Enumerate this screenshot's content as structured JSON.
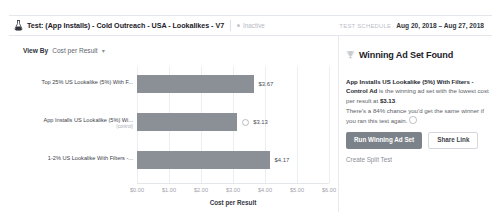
{
  "header": {
    "flask_icon": "flask-icon",
    "title": "Test: (App Installs) - Cold Outreach - USA - Lookalikes - V7",
    "status_badge": "Inactive",
    "schedule_label": "TEST SCHEDULE",
    "schedule_dates": "Aug 20, 2018 – Aug 27, 2018"
  },
  "chart_panel": {
    "view_by_label": "View By",
    "view_by_value": "Cost per Result",
    "caret_icon": "chevron-down-icon"
  },
  "side_panel": {
    "trophy_icon": "trophy-icon",
    "title": "Winning Ad Set Found",
    "body_bold": "App Installs US Lookalike (5%) With Filters - Control Ad",
    "body_rest": " is the winning ad set with the lowest cost per result at ",
    "body_value": "$3.13",
    "body_end": ".",
    "probability_text": "There's a 84% chance you'd get the same winner if you ran this test again.",
    "info_icon": "info-icon",
    "primary_button": "Run Winning Ad Set",
    "secondary_button": "Share Link",
    "create_split_test_link": "Create Split Test"
  },
  "colors": {
    "bar": "#8a9096",
    "primary_button": "#7c8289",
    "gridline": "#eceef1",
    "text": "#1d2129",
    "muted": "#9ea3a9"
  },
  "chart_data": {
    "type": "bar",
    "orientation": "horizontal",
    "title": "",
    "xlabel": "Cost per Result",
    "ylabel": "",
    "xlim": [
      0,
      6
    ],
    "grid": true,
    "legend": false,
    "ticks": [
      "$0.00",
      "$1.00",
      "$2.00",
      "$3.00",
      "$4.00",
      "$5.00",
      "$6.00"
    ],
    "tick_values": [
      0,
      1,
      2,
      3,
      4,
      5,
      6
    ],
    "categories": [
      "Top 25% US Lookalike (5%) With F...",
      "App Installs US Lookalike (5%) Wi...",
      "1-2% US Lookalike With Filters -..."
    ],
    "category_sublabels": [
      "",
      "(control)",
      ""
    ],
    "values": [
      3.67,
      3.13,
      4.17
    ],
    "value_labels": [
      "$3.67",
      "$3.13",
      "$4.17"
    ],
    "winner_index": 1,
    "winner_marker": "winner-dot-icon"
  }
}
